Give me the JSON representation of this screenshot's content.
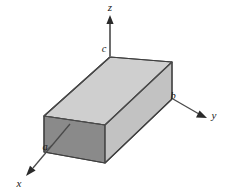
{
  "figure": {
    "background_color": "#ffffff",
    "line_color": "#3a3a3a",
    "axes": [
      {
        "id": "z",
        "label": "z",
        "label_x": 110,
        "label_y": 11,
        "direction": "up"
      },
      {
        "id": "y",
        "label": "y",
        "label_x": 214,
        "label_y": 119,
        "direction": "right-down"
      },
      {
        "id": "x",
        "label": "x",
        "label_x": 19,
        "label_y": 187,
        "direction": "left-down"
      }
    ],
    "dimensions": [
      {
        "id": "a",
        "label": "a",
        "label_x": 45,
        "label_y": 150,
        "edge": "x-depth"
      },
      {
        "id": "b",
        "label": "b",
        "label_x": 173,
        "label_y": 99,
        "edge": "y-length"
      },
      {
        "id": "c",
        "label": "c",
        "label_x": 104,
        "label_y": 52,
        "edge": "z-height"
      }
    ],
    "box": {
      "top_face_color": "#cccccc",
      "front_face_color": "#8a8a8a",
      "side_face_color": "#c2c2c2",
      "edge_color": "#4a4a4a"
    },
    "origin": {
      "x": 110,
      "y": 96
    }
  }
}
